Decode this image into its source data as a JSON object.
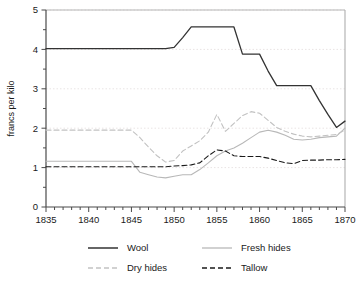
{
  "chart_data": {
    "type": "line",
    "title": "",
    "xlabel": "",
    "ylabel": "francs per kilo",
    "xlim": [
      1835,
      1870
    ],
    "ylim": [
      0,
      5
    ],
    "ytick_labels": [
      "0",
      "1",
      "2",
      "3",
      "4",
      "5"
    ],
    "yticks": [
      0,
      1,
      2,
      3,
      4,
      5
    ],
    "yminor_step": 0.5,
    "xtick_labels": [
      "1835",
      "1840",
      "1845",
      "1850",
      "1855",
      "1860",
      "1865",
      "1870"
    ],
    "xticks": [
      1835,
      1840,
      1845,
      1850,
      1855,
      1860,
      1865,
      1870
    ],
    "xminor_step": 1,
    "grid": "horizontal-dotted",
    "legend_position": "bottom",
    "x": [
      1835,
      1836,
      1837,
      1838,
      1839,
      1840,
      1841,
      1842,
      1843,
      1844,
      1845,
      1846,
      1847,
      1848,
      1849,
      1850,
      1851,
      1852,
      1853,
      1854,
      1855,
      1856,
      1857,
      1858,
      1859,
      1860,
      1861,
      1862,
      1863,
      1864,
      1865,
      1866,
      1867,
      1868,
      1869,
      1870
    ],
    "series": [
      {
        "name": "Wool",
        "color": "#333333",
        "style": "solid",
        "values": [
          4.02,
          4.02,
          4.02,
          4.02,
          4.02,
          4.02,
          4.02,
          4.02,
          4.02,
          4.02,
          4.02,
          4.02,
          4.02,
          4.02,
          4.02,
          4.05,
          4.3,
          4.57,
          4.57,
          4.57,
          4.57,
          4.57,
          4.57,
          3.88,
          3.88,
          3.88,
          3.45,
          3.08,
          3.08,
          3.08,
          3.08,
          3.08,
          2.7,
          2.35,
          2.02,
          2.18
        ]
      },
      {
        "name": "Fresh hides",
        "color": "#b8b8b8",
        "style": "solid",
        "values": [
          1.16,
          1.16,
          1.16,
          1.16,
          1.16,
          1.16,
          1.16,
          1.16,
          1.16,
          1.16,
          1.16,
          0.88,
          0.82,
          0.76,
          0.74,
          0.78,
          0.82,
          0.82,
          0.95,
          1.12,
          1.3,
          1.42,
          1.5,
          1.62,
          1.76,
          1.9,
          1.95,
          1.9,
          1.82,
          1.72,
          1.7,
          1.72,
          1.76,
          1.78,
          1.8,
          2.0
        ]
      },
      {
        "name": "Dry hides",
        "color": "#c2c2c2",
        "style": "dashed",
        "values": [
          1.95,
          1.95,
          1.95,
          1.95,
          1.95,
          1.95,
          1.95,
          1.95,
          1.95,
          1.95,
          1.95,
          1.76,
          1.52,
          1.3,
          1.14,
          1.18,
          1.42,
          1.55,
          1.68,
          1.9,
          2.35,
          1.92,
          2.12,
          2.32,
          2.42,
          2.38,
          2.2,
          2.02,
          1.92,
          1.85,
          1.8,
          1.78,
          1.8,
          1.82,
          1.84,
          1.95
        ]
      },
      {
        "name": "Tallow",
        "color": "#1a1a1a",
        "style": "dashed",
        "values": [
          1.02,
          1.02,
          1.02,
          1.02,
          1.02,
          1.02,
          1.02,
          1.02,
          1.02,
          1.02,
          1.02,
          1.02,
          1.02,
          1.02,
          1.02,
          1.04,
          1.05,
          1.07,
          1.12,
          1.3,
          1.45,
          1.42,
          1.3,
          1.28,
          1.28,
          1.28,
          1.24,
          1.18,
          1.12,
          1.1,
          1.18,
          1.19,
          1.19,
          1.2,
          1.2,
          1.21
        ]
      }
    ]
  },
  "legend": {
    "items": [
      {
        "label": "Wool",
        "key": "wool"
      },
      {
        "label": "Fresh hides",
        "key": "fresh-hides"
      },
      {
        "label": "Dry hides",
        "key": "dry-hides"
      },
      {
        "label": "Tallow",
        "key": "tallow"
      }
    ]
  }
}
